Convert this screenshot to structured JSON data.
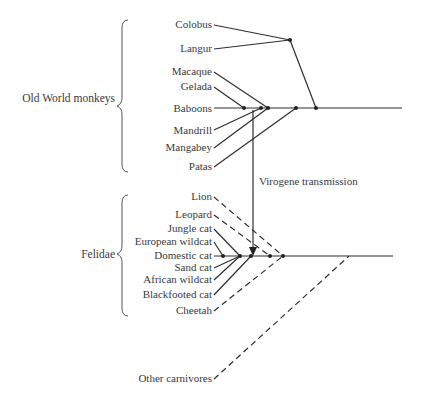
{
  "diagram": {
    "type": "phylogenetic-tree",
    "groups": [
      {
        "label": "Old World monkeys",
        "members": [
          "Colobus",
          "Langur",
          "Macaque",
          "Gelada",
          "Baboons",
          "Mandrill",
          "Mangabey",
          "Patas"
        ]
      },
      {
        "label": "Felidae",
        "members": [
          "Lion",
          "Leopard",
          "Jungle cat",
          "European wildcat",
          "Domestic cat",
          "Sand cat",
          "African wildcat",
          "Blackfooted cat",
          "Cheetah"
        ]
      }
    ],
    "monkeys": {
      "colobus": "Colobus",
      "langur": "Langur",
      "macaque": "Macaque",
      "gelada": "Gelada",
      "baboons": "Baboons",
      "mandrill": "Mandrill",
      "mangabey": "Mangabey",
      "patas": "Patas"
    },
    "cats": {
      "lion": "Lion",
      "leopard": "Leopard",
      "jungle_cat": "Jungle cat",
      "european_wildcat": "European wildcat",
      "domestic_cat": "Domestic cat",
      "sand_cat": "Sand cat",
      "african_wildcat": "African wildcat",
      "blackfooted_cat": "Blackfooted cat",
      "cheetah": "Cheetah"
    },
    "other": "Other carnivores",
    "transfer_label": "Virogene transmission",
    "legend_note": {
      "solid_line": "virogene-related lineage",
      "dashed_line": "lineages lacking the transmitted virogene"
    }
  }
}
